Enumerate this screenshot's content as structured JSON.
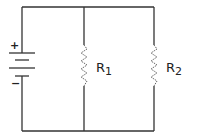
{
  "diagram": {
    "type": "parallel-circuit",
    "colors": {
      "wire": "#333333",
      "resistor": "#666666",
      "background": "#ffffff"
    },
    "battery": {
      "positive_label": "+",
      "negative_label": "−"
    },
    "resistors": [
      {
        "name": "R",
        "subscript": "1"
      },
      {
        "name": "R",
        "subscript": "2"
      }
    ]
  }
}
